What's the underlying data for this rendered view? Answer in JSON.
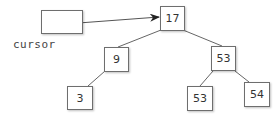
{
  "diagram": {
    "type": "binary-search-tree-with-cursor",
    "cursor": {
      "label": "cursor",
      "points_to": "root"
    },
    "nodes": {
      "root": {
        "value": "17"
      },
      "left": {
        "value": "9"
      },
      "right": {
        "value": "53"
      },
      "left_left": {
        "value": "3"
      },
      "right_left": {
        "value": "53"
      },
      "right_right": {
        "value": "54"
      }
    },
    "edges": [
      [
        "root",
        "left"
      ],
      [
        "root",
        "right"
      ],
      [
        "left",
        "left_left"
      ],
      [
        "right",
        "right_left"
      ],
      [
        "right",
        "right_right"
      ]
    ],
    "colors": {
      "stroke": "#6e6e6e",
      "text": "#333333",
      "background": "#ffffff"
    }
  }
}
